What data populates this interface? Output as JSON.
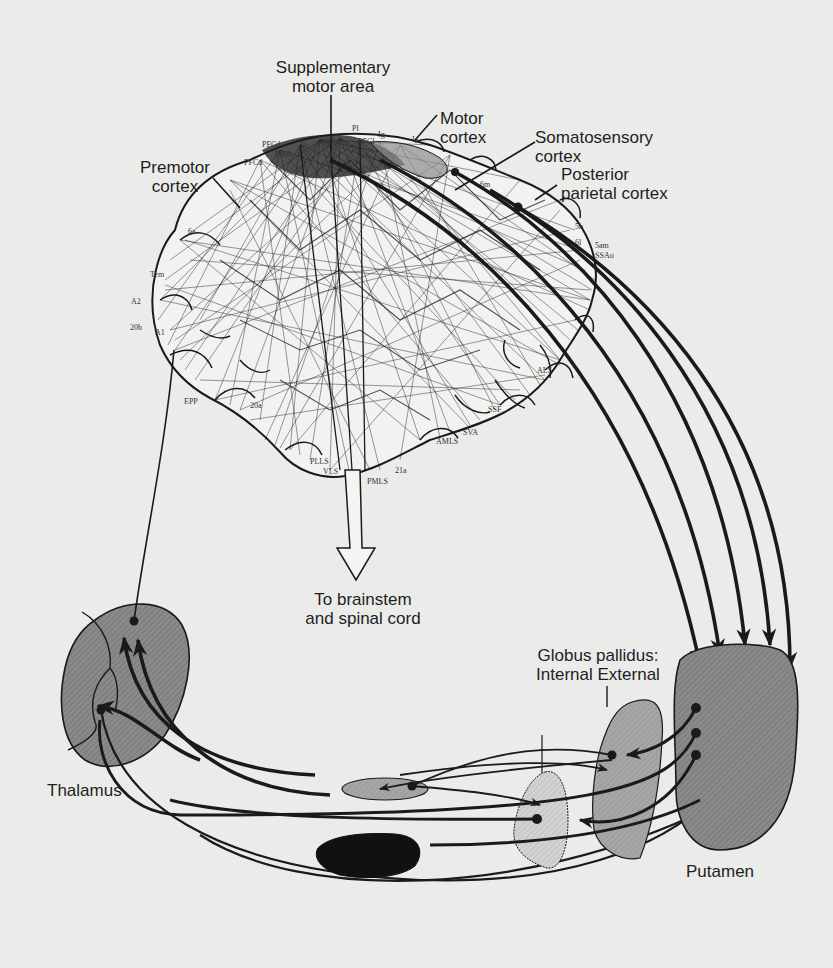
{
  "figure": {
    "background_color": "#ebebea",
    "line_color": "#1a1a1a"
  },
  "cortex_labels": {
    "supplementary_motor_area": [
      "Supplementary",
      "motor area"
    ],
    "motor_cortex": [
      "Motor",
      "cortex"
    ],
    "somatosensory_cortex": [
      "Somatosensory",
      "cortex"
    ],
    "posterior_parietal_cortex": [
      "Posterior",
      "parietal cortex"
    ],
    "premotor_cortex": [
      "Premotor",
      "cortex"
    ]
  },
  "area_labels": [
    {
      "text": "PFCd",
      "x": 262,
      "y": 140
    },
    {
      "text": "PFCd",
      "x": 244,
      "y": 158
    },
    {
      "text": "PsbR",
      "x": 275,
      "y": 150
    },
    {
      "text": "Sh",
      "x": 300,
      "y": 141
    },
    {
      "text": "Hipp",
      "x": 318,
      "y": 135
    },
    {
      "text": "Pl",
      "x": 352,
      "y": 124
    },
    {
      "text": "PFCl",
      "x": 358,
      "y": 137
    },
    {
      "text": "Ig",
      "x": 378,
      "y": 130
    },
    {
      "text": "Ia",
      "x": 412,
      "y": 135
    },
    {
      "text": "6m",
      "x": 480,
      "y": 180
    },
    {
      "text": "5b",
      "x": 575,
      "y": 222
    },
    {
      "text": "6l",
      "x": 575,
      "y": 238
    },
    {
      "text": "5am",
      "x": 595,
      "y": 241
    },
    {
      "text": "SSAo",
      "x": 595,
      "y": 251
    },
    {
      "text": "6a",
      "x": 188,
      "y": 227
    },
    {
      "text": "Tem",
      "x": 150,
      "y": 270
    },
    {
      "text": "A2",
      "x": 131,
      "y": 297
    },
    {
      "text": "20b",
      "x": 130,
      "y": 323
    },
    {
      "text": "A1",
      "x": 155,
      "y": 328
    },
    {
      "text": "EPP",
      "x": 184,
      "y": 397
    },
    {
      "text": "20a",
      "x": 250,
      "y": 401
    },
    {
      "text": "SSF",
      "x": 488,
      "y": 405
    },
    {
      "text": "ALS",
      "x": 537,
      "y": 366
    },
    {
      "text": "SVA",
      "x": 463,
      "y": 428
    },
    {
      "text": "AMLS",
      "x": 436,
      "y": 437
    },
    {
      "text": "PLLS",
      "x": 310,
      "y": 457
    },
    {
      "text": "VLS",
      "x": 323,
      "y": 467
    },
    {
      "text": "PMLS",
      "x": 367,
      "y": 477
    },
    {
      "text": "21a",
      "x": 395,
      "y": 466
    }
  ],
  "output_label": [
    "To brainstem",
    "and spinal cord"
  ],
  "nuclei": {
    "globus_pallidus": [
      "Globus pallidus:",
      "Internal External"
    ],
    "thalamus": "Thalamus",
    "putamen": "Putamen"
  },
  "colors": {
    "thalamus_fill": "#8e8e8e",
    "putamen_fill": "#8a8a8a",
    "gp_external_fill": "#a5a5a5",
    "gp_internal_fill": "#cdcdcd",
    "subthalamic_fill": "#a9a9a9",
    "substantia_nigra_fill": "#111111",
    "cortex_fill": "#f2f2f1"
  }
}
